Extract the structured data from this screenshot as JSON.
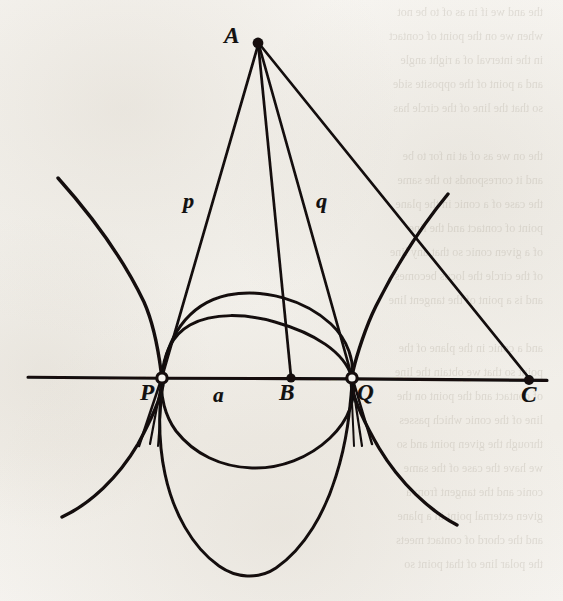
{
  "figure": {
    "kind": "geometry-diagram",
    "media": "scanned book page, black ink line drawing on aged off-white paper",
    "background_color": "#f5f3ef",
    "ink_color": "#121110",
    "canvas": {
      "width": 563,
      "height": 601
    },
    "labels": [
      {
        "id": "label-A",
        "text": "A",
        "style": "capital-italic-bold",
        "x": 228,
        "y": 26,
        "describes": "apex point of the pencil of lines"
      },
      {
        "id": "label-p",
        "text": "p",
        "style": "lowercase-italic-bold",
        "x": 183,
        "y": 190,
        "describes": "segment from A to P"
      },
      {
        "id": "label-q",
        "text": "q",
        "style": "lowercase-italic-bold",
        "x": 315,
        "y": 190,
        "describes": "segment from A to Q"
      },
      {
        "id": "label-P",
        "text": "P",
        "style": "capital-italic-bold",
        "x": 142,
        "y": 382,
        "describes": "left intersection point on the base line"
      },
      {
        "id": "label-a",
        "text": "a",
        "style": "lowercase-italic-bold",
        "x": 212,
        "y": 384,
        "describes": "distance along the base line between P and B"
      },
      {
        "id": "label-B",
        "text": "B",
        "style": "capital-italic-bold",
        "x": 279,
        "y": 382,
        "describes": "foot point on the base line between P and Q"
      },
      {
        "id": "label-Q",
        "text": "Q",
        "style": "capital-italic-bold",
        "x": 357,
        "y": 382,
        "describes": "right intersection point on the base line"
      },
      {
        "id": "label-C",
        "text": "C",
        "style": "capital-italic-bold",
        "x": 521,
        "y": 384,
        "describes": "far right point on the base line"
      }
    ],
    "points": [
      {
        "id": "point-A",
        "name": "A",
        "x": 258,
        "y": 43,
        "marker": "filled-dot"
      },
      {
        "id": "point-P",
        "name": "P",
        "x": 162,
        "y": 378,
        "marker": "open-circle"
      },
      {
        "id": "point-B",
        "name": "B",
        "x": 291,
        "y": 378,
        "marker": "filled-dot"
      },
      {
        "id": "point-Q",
        "name": "Q",
        "x": 352,
        "y": 378,
        "marker": "open-circle"
      },
      {
        "id": "point-C",
        "name": "C",
        "x": 529,
        "y": 380,
        "marker": "filled-dot"
      }
    ],
    "base_line": {
      "id": "base-line",
      "x1": 28,
      "y1": 377,
      "x2": 547,
      "y2": 380
    },
    "rays_from_A": [
      {
        "id": "ray-A-P",
        "from": "A",
        "to": "P",
        "label": "p"
      },
      {
        "id": "ray-A-B",
        "from": "A",
        "to": "B",
        "label": ""
      },
      {
        "id": "ray-A-Q",
        "from": "A",
        "to": "Q",
        "label": "q"
      },
      {
        "id": "ray-A-C",
        "from": "A",
        "to": "C",
        "label": ""
      }
    ],
    "curves": [
      {
        "id": "hyperbola-left-branch",
        "kind": "hyperbola-branch",
        "through": "P",
        "opens": "up-left and down-left"
      },
      {
        "id": "hyperbola-right-branch",
        "kind": "hyperbola-branch",
        "through": "Q",
        "opens": "up-right and down-right"
      },
      {
        "id": "circle-through-PQ",
        "kind": "circle",
        "through": [
          "P",
          "Q"
        ],
        "lowest_y": 468
      },
      {
        "id": "oval-through-PQ",
        "kind": "oval",
        "through": [
          "P",
          "Q"
        ],
        "lowest_y": 574
      }
    ],
    "ghost_text_lines": [
      "the and we if in as of to be not",
      "when we on the point of contact",
      "in the interval of a right angle",
      "and a point of the opposite side",
      "so that the line of the circle has",
      "",
      "the on we as of at in for to be",
      "and it corresponds to the same",
      "the case of a conic in the plane",
      "point of contact and the line",
      "of a given conic so that any line",
      "of the circle the locus becomes",
      "and is a point of the tangent line",
      "",
      "and a conic in the plane of the",
      "point so that we obtain the line",
      "of contact and the point on the",
      "line of the conic which passes",
      "through the given point and so",
      "we have the case of the same",
      "conic and the tangent from a"
    ]
  }
}
